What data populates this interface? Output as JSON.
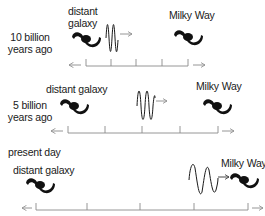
{
  "panels": [
    {
      "era_label": "10 billion years ago",
      "era_line1": "10 billion",
      "era_line2": "years ago",
      "distant_galaxy_label_line1": "distant",
      "distant_galaxy_label_line2": "galaxy",
      "milky_way_label": "Milky Way",
      "tick_count": 5
    },
    {
      "era_label": "5 billion years ago",
      "era_line1": "5 billion",
      "era_line2": "years ago",
      "distant_galaxy_label": "distant galaxy",
      "milky_way_label": "Milky Way",
      "tick_count": 5
    },
    {
      "era_label": "present day",
      "distant_galaxy_label": "distant galaxy",
      "milky_way_label": "Milky Way",
      "tick_count": 5
    }
  ],
  "icons": {
    "galaxy": "spiral-galaxy-icon",
    "wave": "light-wave-icon",
    "arrow": "right-arrow-icon"
  },
  "colors": {
    "ink": "#1a1a1a",
    "axis": "#8a8a8a"
  }
}
